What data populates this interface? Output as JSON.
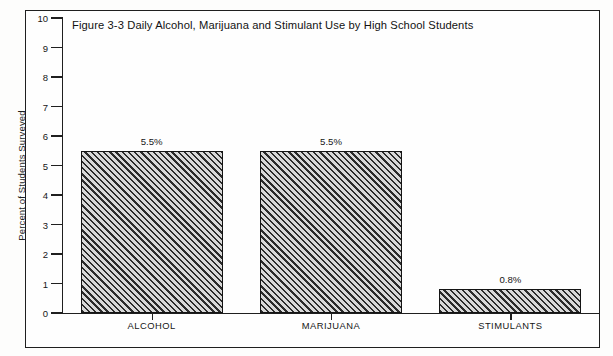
{
  "chart_data": {
    "type": "bar",
    "title": "Figure 3-3 Daily Alcohol, Marijuana and Stimulant Use by High School Students",
    "categories": [
      "ALCOHOL",
      "MARIJUANA",
      "STIMULANTS"
    ],
    "values": [
      5.5,
      5.5,
      0.8
    ],
    "data_labels": [
      "5.5%",
      "5.5%",
      "0.8%"
    ],
    "xlabel": "",
    "ylabel": "Percent of Students Surveyed",
    "ylim": [
      0,
      10
    ],
    "ytick_labels": [
      "0",
      "1",
      "2",
      "3",
      "4",
      "5",
      "6",
      "7",
      "8",
      "9",
      "10"
    ],
    "ytick_values": [
      0,
      1,
      2,
      3,
      4,
      5,
      6,
      7,
      8,
      9,
      10
    ],
    "grid": false,
    "legend": false,
    "bar_fill": "hatched-diagonal",
    "colors": {
      "hatch_dark": "#2b2b2b",
      "hatch_light": "#d8d8d8",
      "bar_outline": "#141414",
      "axis": "#1f1f1f",
      "frame": "#1f1f1f",
      "background": "#fefefe",
      "text": "#161616"
    }
  }
}
